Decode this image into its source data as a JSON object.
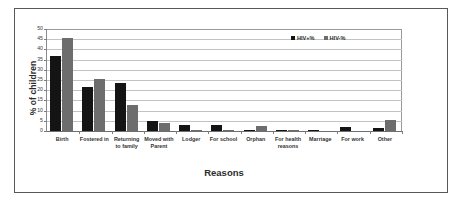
{
  "figure": {
    "border_color": "#58585a",
    "background": "#ffffff"
  },
  "chart_data": {
    "type": "bar",
    "title": "",
    "xlabel": "Reasons",
    "ylabel": "% of children",
    "ylim": [
      0,
      50
    ],
    "yticks": [
      0,
      5,
      10,
      15,
      20,
      25,
      30,
      35,
      40,
      45,
      50
    ],
    "grid": true,
    "legend_position": "top-right",
    "categories": [
      "Birth",
      "Fostered in",
      "Returning to family",
      "Moved with Parent",
      "Lodger",
      "For school",
      "Orphan",
      "For health reasons",
      "Marriage",
      "For work",
      "Other"
    ],
    "category_lines": [
      [
        "Birth"
      ],
      [
        "Fostered in"
      ],
      [
        "Returning",
        "to family"
      ],
      [
        "Moved with",
        "Parent"
      ],
      [
        "Lodger"
      ],
      [
        "For school"
      ],
      [
        "Orphan"
      ],
      [
        "For health",
        "reasons"
      ],
      [
        "Marriage"
      ],
      [
        "For work"
      ],
      [
        "Other"
      ]
    ],
    "series": [
      {
        "name": "HIV+%",
        "color": "#141414",
        "values": [
          36.6,
          21.8,
          23.7,
          4.8,
          2.8,
          2.8,
          0.7,
          0.5,
          0.5,
          1.8,
          1.7
        ]
      },
      {
        "name": "HIV-%",
        "color": "#6d6d6d",
        "values": [
          45.7,
          25.5,
          12.8,
          3.9,
          0.5,
          0.5,
          2.7,
          0.5,
          0.0,
          0.0,
          5.5
        ]
      }
    ]
  }
}
